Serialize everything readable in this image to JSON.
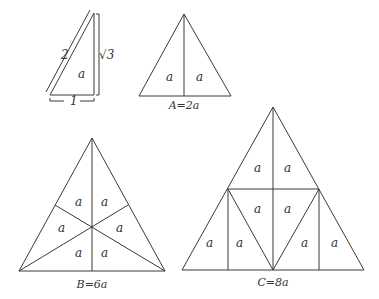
{
  "figure": {
    "right_triangle": {
      "hypotenuse_label": "2",
      "height_label": "√3",
      "base_label": "1",
      "area_label": "a"
    },
    "triangle_A": {
      "caption": "A=2a",
      "regions": [
        "a",
        "a"
      ]
    },
    "triangle_B": {
      "caption": "B=6a",
      "regions": [
        "a",
        "a",
        "a",
        "a",
        "a",
        "a"
      ]
    },
    "triangle_C": {
      "caption": "C=8a",
      "regions": [
        "a",
        "a",
        "a",
        "a",
        "a",
        "a",
        "a",
        "a"
      ]
    }
  }
}
